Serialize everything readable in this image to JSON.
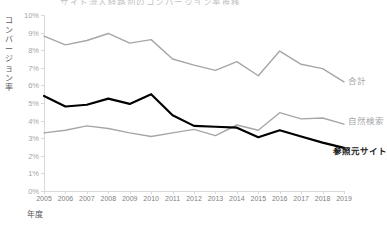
{
  "chart_data": {
    "type": "line",
    "title": "サイト流入経路別のコンバージョン率推移",
    "xlabel": "年度",
    "ylabel": "コンバージョン率",
    "x": [
      2005,
      2006,
      2007,
      2008,
      2009,
      2010,
      2011,
      2012,
      2013,
      2014,
      2015,
      2016,
      2017,
      2018,
      2019
    ],
    "categories": [
      "2005",
      "2006",
      "2007",
      "2008",
      "2009",
      "2010",
      "2011",
      "2012",
      "2013",
      "2014",
      "2015",
      "2016",
      "2017",
      "2018",
      "2019"
    ],
    "ylim": [
      0,
      10
    ],
    "ytick_labels": [
      "0%",
      "1%",
      "2%",
      "3%",
      "4%",
      "5%",
      "6%",
      "7%",
      "8%",
      "9%",
      "10%"
    ],
    "ytick_values": [
      0,
      1,
      2,
      3,
      4,
      5,
      6,
      7,
      8,
      9,
      10
    ],
    "grid": false,
    "legend": "direct-end-labels",
    "series": [
      {
        "name": "合計",
        "color": "#a6a6a6",
        "width": 1.4,
        "bold": false,
        "values": [
          8.8,
          8.3,
          8.55,
          8.95,
          8.4,
          8.6,
          7.5,
          7.15,
          6.85,
          7.35,
          6.55,
          7.95,
          7.2,
          6.95,
          6.2
        ]
      },
      {
        "name": "自然検索",
        "color": "#a6a6a6",
        "width": 1.4,
        "bold": false,
        "values": [
          3.3,
          3.45,
          3.7,
          3.55,
          3.3,
          3.1,
          3.3,
          3.5,
          3.15,
          3.75,
          3.45,
          4.45,
          4.1,
          4.15,
          3.8
        ]
      },
      {
        "name": "参照元サイト",
        "color": "#000000",
        "width": 2.2,
        "bold": true,
        "values": [
          5.4,
          4.8,
          4.9,
          5.25,
          4.95,
          5.5,
          4.3,
          3.7,
          3.65,
          3.6,
          3.05,
          3.45,
          3.1,
          2.75,
          2.45
        ]
      }
    ]
  }
}
